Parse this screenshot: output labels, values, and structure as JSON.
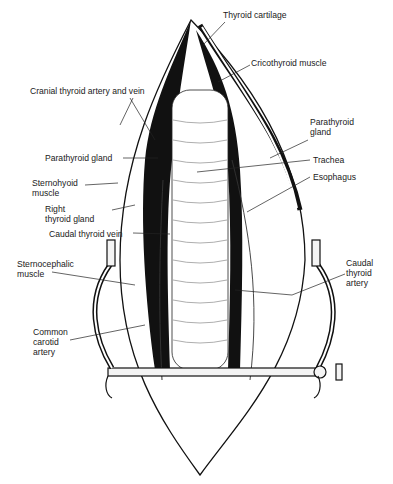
{
  "figure": {
    "labels": [
      {
        "id": "thyroid-cartilage",
        "text": "Thyroid cartilage",
        "x": 223,
        "y": 15
      },
      {
        "id": "cricothyroid-muscle",
        "text": "Cricothyroid muscle",
        "x": 251,
        "y": 58
      },
      {
        "id": "cranial-thyroid-artery-vein",
        "text": "Cranial thyroid artery and vein",
        "x": 30,
        "y": 87
      },
      {
        "id": "parathyroid-gland-right",
        "text": "Parathyroid\ngland",
        "x": 310,
        "y": 116
      },
      {
        "id": "parathyroid-gland-left",
        "text": "Parathyroid gland",
        "x": 45,
        "y": 153
      },
      {
        "id": "trachea",
        "text": "Trachea",
        "x": 313,
        "y": 155
      },
      {
        "id": "sternohyoid-muscle",
        "text": "Sternohyoid\nmuscle",
        "x": 32,
        "y": 177
      },
      {
        "id": "esophagus",
        "text": "Esophagus",
        "x": 313,
        "y": 172
      },
      {
        "id": "right-thyroid-gland",
        "text": "Right\nthyroid gland",
        "x": 45,
        "y": 204
      },
      {
        "id": "caudal-thyroid-vein",
        "text": "Caudal thyroid vein",
        "x": 49,
        "y": 230
      },
      {
        "id": "sternocephalic-muscle",
        "text": "Sternocephalic\nmuscle",
        "x": 17,
        "y": 258
      },
      {
        "id": "caudal-thyroid-artery",
        "text": "Caudal\nthyroid\nartery",
        "x": 346,
        "y": 258
      },
      {
        "id": "common-carotid-artery",
        "text": "Common\ncarotid\nartery",
        "x": 33,
        "y": 325
      }
    ]
  }
}
